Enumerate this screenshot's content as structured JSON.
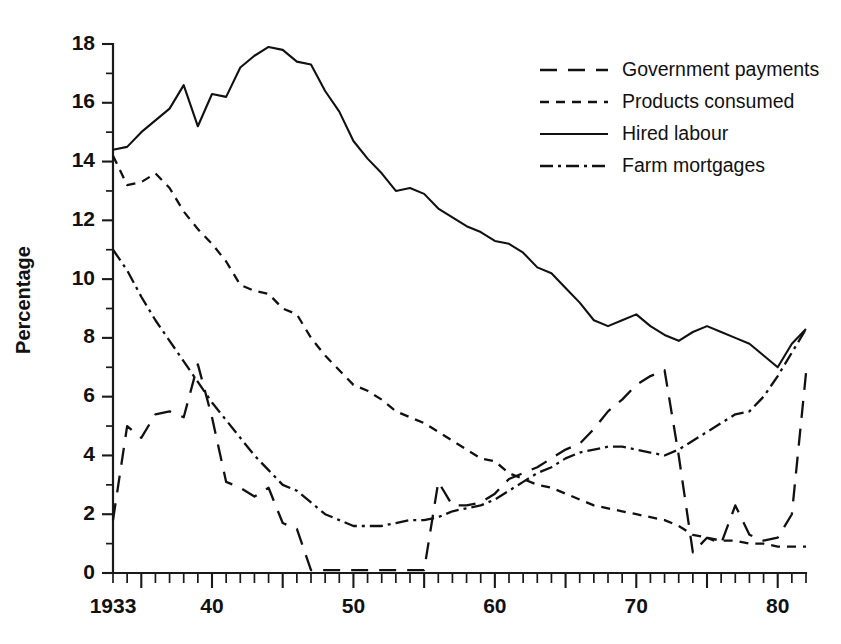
{
  "chart_data": {
    "type": "line",
    "title": "",
    "xlabel": "",
    "ylabel": "Percentage",
    "xlim": [
      1933,
      1982
    ],
    "ylim": [
      0,
      18
    ],
    "ytick_step": 2,
    "yminor_step": 1,
    "xtick_step": 1,
    "grid": false,
    "legend_position": "top-right",
    "xticklabels": [
      "1933",
      "40",
      "50",
      "60",
      "70",
      "80"
    ],
    "xticklabel_values": [
      1933,
      1940,
      1950,
      1960,
      1970,
      1980
    ],
    "yticklabels": [
      "0",
      "2",
      "4",
      "6",
      "8",
      "10",
      "12",
      "14",
      "16",
      "18"
    ],
    "yticklabel_values": [
      0,
      2,
      4,
      6,
      8,
      10,
      12,
      14,
      16,
      18
    ],
    "x": [
      1933,
      1934,
      1935,
      1936,
      1937,
      1938,
      1939,
      1940,
      1941,
      1942,
      1943,
      1944,
      1945,
      1946,
      1947,
      1948,
      1949,
      1950,
      1951,
      1952,
      1953,
      1954,
      1955,
      1956,
      1957,
      1958,
      1959,
      1960,
      1961,
      1962,
      1963,
      1964,
      1965,
      1966,
      1967,
      1968,
      1969,
      1970,
      1971,
      1972,
      1973,
      1974,
      1975,
      1976,
      1977,
      1978,
      1979,
      1980,
      1981,
      1982
    ],
    "series": [
      {
        "name": "Government payments",
        "style": "long-dash",
        "dasharray": "17,11",
        "linewidth": 2.3,
        "values": [
          1.8,
          5.0,
          4.6,
          5.4,
          5.5,
          5.3,
          7.1,
          5.3,
          3.1,
          2.9,
          2.6,
          2.9,
          1.7,
          1.5,
          0.1,
          0.1,
          0.1,
          0.1,
          0.1,
          0.1,
          0.1,
          0.1,
          0.1,
          3.1,
          2.3,
          2.3,
          2.4,
          2.7,
          3.2,
          3.4,
          3.6,
          3.9,
          4.2,
          4.4,
          4.9,
          5.5,
          5.9,
          6.4,
          6.7,
          6.9,
          4.0,
          0.7,
          1.2,
          1.0,
          2.3,
          1.3,
          1.1,
          1.2,
          2.0,
          6.8
        ]
      },
      {
        "name": "Products consumed",
        "style": "short-dash",
        "dasharray": "9,7",
        "linewidth": 2.3,
        "values": [
          14.2,
          13.2,
          13.3,
          13.6,
          13.1,
          12.3,
          11.7,
          11.2,
          10.6,
          9.8,
          9.6,
          9.5,
          9.0,
          8.8,
          8.0,
          7.4,
          6.9,
          6.4,
          6.2,
          5.9,
          5.5,
          5.3,
          5.1,
          4.8,
          4.5,
          4.2,
          3.9,
          3.8,
          3.4,
          3.2,
          3.0,
          2.9,
          2.7,
          2.5,
          2.3,
          2.2,
          2.1,
          2.0,
          1.9,
          1.8,
          1.6,
          1.3,
          1.2,
          1.1,
          1.1,
          1.0,
          1.0,
          0.9,
          0.9,
          0.9
        ]
      },
      {
        "name": "Hired labour",
        "style": "solid",
        "dasharray": "none",
        "linewidth": 2.1,
        "values": [
          14.4,
          14.5,
          15.0,
          15.4,
          15.8,
          16.6,
          15.2,
          16.3,
          16.2,
          17.2,
          17.6,
          17.9,
          17.8,
          17.4,
          17.3,
          16.4,
          15.7,
          14.7,
          14.1,
          13.6,
          13.0,
          13.1,
          12.9,
          12.4,
          12.1,
          11.8,
          11.6,
          11.3,
          11.2,
          10.9,
          10.4,
          10.2,
          9.7,
          9.2,
          8.6,
          8.4,
          8.6,
          8.8,
          8.4,
          8.1,
          7.9,
          8.2,
          8.4,
          8.2,
          8.0,
          7.8,
          7.4,
          7.0,
          7.8,
          8.3
        ]
      },
      {
        "name": "Farm mortgages",
        "style": "dash-dot",
        "dasharray": "13,5,3,5",
        "linewidth": 2.3,
        "values": [
          11.0,
          10.3,
          9.4,
          8.6,
          7.9,
          7.2,
          6.5,
          5.8,
          5.2,
          4.6,
          4.0,
          3.5,
          3.0,
          2.8,
          2.4,
          2.0,
          1.8,
          1.6,
          1.6,
          1.6,
          1.7,
          1.8,
          1.8,
          1.9,
          2.1,
          2.2,
          2.3,
          2.5,
          2.8,
          3.1,
          3.4,
          3.6,
          3.9,
          4.1,
          4.2,
          4.3,
          4.3,
          4.2,
          4.1,
          4.0,
          4.2,
          4.5,
          4.8,
          5.1,
          5.4,
          5.5,
          6.0,
          6.7,
          7.5,
          8.3
        ]
      }
    ]
  },
  "legend": {
    "items": [
      {
        "label": "Government payments"
      },
      {
        "label": "Products consumed"
      },
      {
        "label": "Hired labour"
      },
      {
        "label": "Farm mortgages"
      }
    ]
  },
  "colors": {
    "ink": "#111111",
    "background": "#ffffff"
  }
}
